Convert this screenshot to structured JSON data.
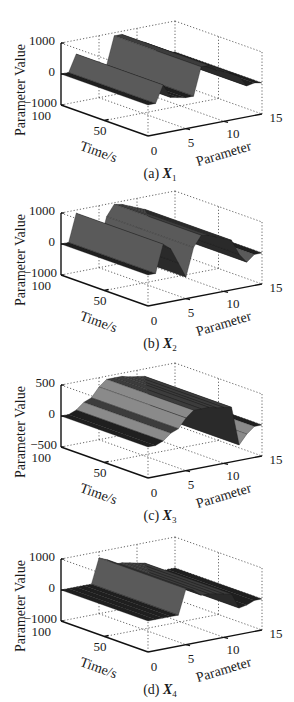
{
  "chart_data": [
    {
      "type": "surface3d",
      "id": "a",
      "caption": {
        "prefix": "(a)",
        "var": "X",
        "sub": "1"
      },
      "xlabel": "Parameter",
      "ylabel": "Time/s",
      "zlabel": "Parameter Value",
      "xticks": [
        "0",
        "5",
        "10",
        "15"
      ],
      "yticks": [
        "100",
        "50"
      ],
      "zticks": [
        "1000",
        "0",
        "−1000"
      ],
      "xlim": [
        0,
        15
      ],
      "ylim": [
        0,
        100
      ],
      "zlim": [
        -1000,
        1000
      ],
      "grid": true,
      "surface_profile": {
        "parameter": [
          0,
          1,
          2,
          3,
          4,
          5,
          6,
          7,
          8,
          9,
          10,
          11,
          12,
          13,
          14,
          15
        ],
        "value": [
          0,
          0,
          550,
          100,
          50,
          0,
          0,
          900,
          900,
          700,
          600,
          500,
          350,
          0,
          50,
          0
        ]
      }
    },
    {
      "type": "surface3d",
      "id": "b",
      "caption": {
        "prefix": "(b)",
        "var": "X",
        "sub": "2"
      },
      "xlabel": "Parameter",
      "ylabel": "Time/s",
      "zlabel": "Parameter Value",
      "xticks": [
        "0",
        "5",
        "10",
        "15"
      ],
      "yticks": [
        "100",
        "50"
      ],
      "zticks": [
        "1000",
        "0",
        "−1000"
      ],
      "xlim": [
        0,
        15
      ],
      "ylim": [
        0,
        100
      ],
      "zlim": [
        -1000,
        1000
      ],
      "grid": true,
      "surface_profile": {
        "parameter": [
          0,
          1,
          2,
          3,
          4,
          5,
          6,
          7,
          8,
          9,
          10,
          11,
          12,
          13,
          14,
          15
        ],
        "value": [
          0,
          0,
          900,
          700,
          200,
          -300,
          600,
          950,
          900,
          800,
          700,
          600,
          100,
          -200,
          0,
          0
        ]
      }
    },
    {
      "type": "surface3d",
      "id": "c",
      "caption": {
        "prefix": "(c)",
        "var": "X",
        "sub": "3"
      },
      "xlabel": "Parameter",
      "ylabel": "Time/s",
      "zlabel": "Parameter Value",
      "xticks": [
        "0",
        "5",
        "10",
        "15"
      ],
      "yticks": [
        "100",
        "50"
      ],
      "zticks": [
        "500",
        "0",
        "−500"
      ],
      "xlim": [
        0,
        15
      ],
      "ylim": [
        0,
        100
      ],
      "zlim": [
        -500,
        500
      ],
      "grid": true,
      "surface_profile": {
        "parameter": [
          0,
          1,
          2,
          3,
          4,
          5,
          6,
          7,
          8,
          9,
          10,
          11,
          12,
          13,
          14,
          15
        ],
        "value": [
          0,
          0,
          50,
          150,
          200,
          350,
          450,
          450,
          450,
          420,
          400,
          380,
          -250,
          -100,
          0,
          0
        ]
      }
    },
    {
      "type": "surface3d",
      "id": "d",
      "caption": {
        "prefix": "(d)",
        "var": "X",
        "sub": "4"
      },
      "xlabel": "Parameter",
      "ylabel": "Time/s",
      "zlabel": "Parameter Value",
      "xticks": [
        "0",
        "5",
        "10",
        "15"
      ],
      "yticks": [
        "100",
        "50"
      ],
      "zticks": [
        "1000",
        "0",
        "−1000"
      ],
      "xlim": [
        0,
        15
      ],
      "ylim": [
        0,
        100
      ],
      "zlim": [
        -1000,
        1000
      ],
      "grid": true,
      "surface_profile": {
        "parameter": [
          0,
          1,
          2,
          3,
          4,
          5,
          6,
          7,
          8,
          9,
          10,
          11,
          12,
          13,
          14,
          15
        ],
        "value": [
          0,
          0,
          0,
          0,
          0,
          800,
          700,
          500,
          500,
          450,
          400,
          350,
          -150,
          -100,
          0,
          0
        ]
      }
    }
  ]
}
